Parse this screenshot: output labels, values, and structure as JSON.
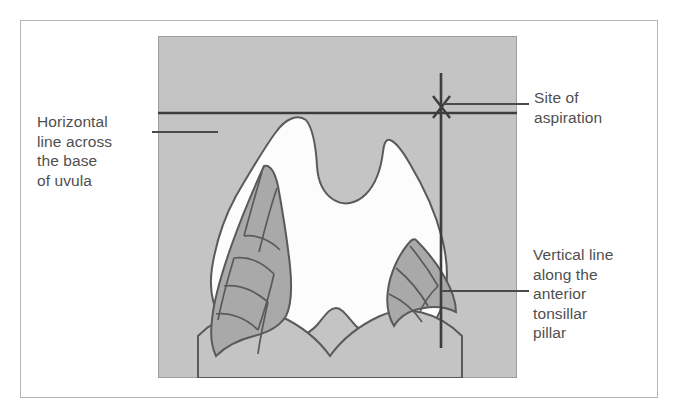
{
  "figure": {
    "type": "anatomical-diagram",
    "labels": {
      "horizontal_line": "Horizontal\nline across\nthe base\nof uvula",
      "site_of_aspiration": "Site of\naspiration",
      "vertical_line": "Vertical line\nalong the\nanterior\ntonsillar\npillar"
    },
    "markers": {
      "aspiration_marker": "X"
    },
    "anatomy": [
      "uvula",
      "soft palate",
      "left palatine tonsil",
      "right palatine tonsil",
      "anterior tonsillar pillar",
      "tongue base",
      "oropharyngeal opening"
    ],
    "colors": {
      "background": "#ffffff",
      "frame_border": "#b6b6b6",
      "panel_gray": "#c4c4c4",
      "tonsil_gray": "#a9a9a9",
      "airway_white": "#fcfcfc",
      "line_dark": "#4a4a4a",
      "outline": "#5a5a5a",
      "text": "#4f4f4f"
    },
    "reference_lines": {
      "horizontal_label": "Horizontal line across the base of uvula",
      "vertical_label": "Vertical line along the anterior tonsillar pillar"
    }
  }
}
